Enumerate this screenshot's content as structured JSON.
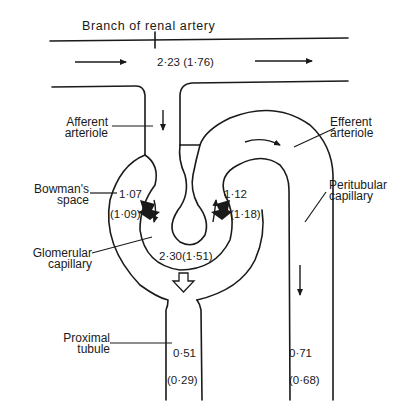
{
  "diagram": {
    "title": "Branch of renal artery",
    "labels": {
      "afferent_line1": "Afferent",
      "afferent_line2": "arteriole",
      "efferent_line1": "Efferent",
      "efferent_line2": "arteriole",
      "bowman_line1": "Bowman's",
      "bowman_line2": "space",
      "peritubular_line1": "Peritubular",
      "peritubular_line2": "capillary",
      "glomerular_line1": "Glomerular",
      "glomerular_line2": "capillary",
      "proximal_line1": "Proximal",
      "proximal_line2": "tubule"
    },
    "values": {
      "renal_artery": "2·23 (1·76)",
      "bowman_in": "1·07",
      "bowman_in_paren": "(1·09)",
      "efferent_in": "1·12",
      "efferent_in_paren": "(1·18)",
      "glomerular": "2·30(1·51)",
      "proximal": "0·51",
      "proximal_paren": "(0·29)",
      "peritubular": "0·71",
      "peritubular_paren": "(0·68)"
    },
    "colors": {
      "ink": "#1a1a1a",
      "background": "#ffffff"
    }
  }
}
